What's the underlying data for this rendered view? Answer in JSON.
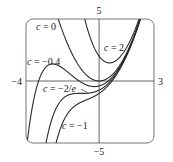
{
  "chart_data": {
    "type": "line",
    "title": "",
    "function": "f(x) = x^2 + c e^{-x}",
    "xlabel": "",
    "ylabel": "",
    "xlim": [
      -4,
      3
    ],
    "ylim": [
      -5,
      5
    ],
    "grid": false,
    "legend": "inline labels",
    "tick_labels": {
      "x_min": "−4",
      "x_max": "3",
      "y_max": "5",
      "y_min": "−5"
    },
    "series": [
      {
        "name": "c = 0",
        "c": 0,
        "label_prefix": "c",
        "label_value": " = 0"
      },
      {
        "name": "c = 2",
        "c": 2,
        "label_prefix": "c",
        "label_value": " = 2"
      },
      {
        "name": "c = −0.4",
        "c": -0.4,
        "label_prefix": "c",
        "label_value": " = −0.4"
      },
      {
        "name": "c = −2/e",
        "c": -0.7357588823,
        "label_prefix": "c",
        "label_value": " = −2/",
        "label_suffix": "e"
      },
      {
        "name": "c = −1",
        "c": -1,
        "label_prefix": "c",
        "label_value": " = −1"
      }
    ]
  },
  "colors": {
    "curve": "#2a2a2a",
    "axis": "#555555",
    "frame": "#777777"
  }
}
